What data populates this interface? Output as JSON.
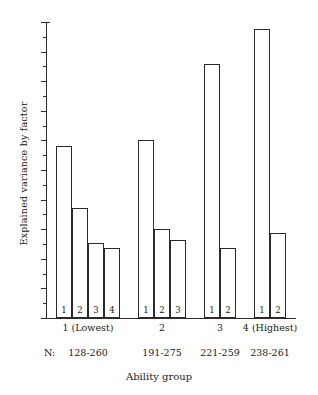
{
  "chart_data": {
    "type": "bar",
    "title": "",
    "subtitle": "",
    "xlabel": "Ability group",
    "ylabel": "Explained variance by factor",
    "ylim": [
      0,
      40
    ],
    "y_unit": "%",
    "y_major_ticks": [
      0,
      4,
      8,
      12,
      16,
      20,
      24,
      28,
      32,
      36,
      40
    ],
    "y_major_tick_labels": [
      "0",
      "4",
      "8",
      "12",
      "16",
      "20",
      "24",
      "28",
      "32",
      "36",
      "40%"
    ],
    "y_minor_tick_step": 2,
    "grid": false,
    "legend": "none",
    "n_caption": "N:",
    "categories": [
      "1 (Lowest)",
      "2",
      "3",
      "4 (Highest)"
    ],
    "n_values": [
      "128-260",
      "191-275",
      "221-259",
      "238-261"
    ],
    "groups": [
      {
        "category": "1 (Lowest)",
        "n": "128-260",
        "factor_labels": [
          "1",
          "2",
          "3",
          "4"
        ],
        "values": [
          23.2,
          14.9,
          10.2,
          9.5
        ]
      },
      {
        "category": "2",
        "n": "191-275",
        "factor_labels": [
          "1",
          "2",
          "3"
        ],
        "values": [
          24.1,
          12.0,
          10.5
        ]
      },
      {
        "category": "3",
        "n": "221-259",
        "factor_labels": [
          "1",
          "2"
        ],
        "values": [
          34.3,
          9.5
        ]
      },
      {
        "category": "4 (Highest)",
        "n": "238-261",
        "factor_labels": [
          "1",
          "2"
        ],
        "values": [
          39.0,
          11.5
        ]
      }
    ],
    "colors": {
      "bar_fill": "#ffffff",
      "bar_stroke": "#2b2b2b",
      "axis": "#2b2b2b",
      "text": "#1a1a1a",
      "background": "#ffffff"
    }
  }
}
